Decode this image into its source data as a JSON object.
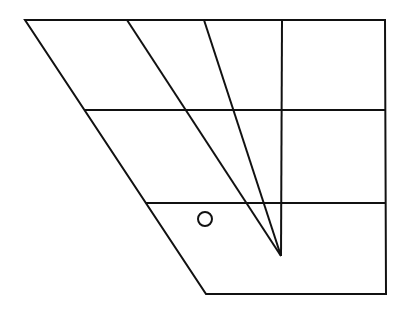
{
  "diagram": {
    "stroke_color": "#111111",
    "background": "#ffffff",
    "stroke_width": 2,
    "outline": {
      "points": [
        [
          25,
          20
        ],
        [
          385,
          20
        ],
        [
          386,
          294
        ],
        [
          206,
          294
        ]
      ]
    },
    "horizontals": [
      {
        "x1": 84,
        "y1": 110,
        "x2": 385,
        "y2": 110
      },
      {
        "x1": 146,
        "y1": 203,
        "x2": 386,
        "y2": 203
      }
    ],
    "rays_to_apex": {
      "apex": [
        281,
        256
      ],
      "starts": [
        [
          127,
          20
        ],
        [
          204,
          20
        ],
        [
          282,
          20
        ]
      ]
    },
    "circle": {
      "cx": 205,
      "cy": 219,
      "r": 7
    }
  }
}
